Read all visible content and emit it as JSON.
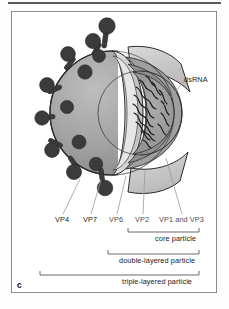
{
  "figure": {
    "panel_letter": "c"
  },
  "callouts": {
    "dsrna": "dsRNA"
  },
  "protein_labels": [
    {
      "id": "vp4",
      "text": "VP4",
      "x": 55,
      "y": 218,
      "tone": "dark"
    },
    {
      "id": "vp7",
      "text": "VP7",
      "x": 84,
      "y": 218,
      "tone": "dark"
    },
    {
      "id": "vp6",
      "text": "VP6",
      "x": 110,
      "y": 218,
      "tone": "grey"
    },
    {
      "id": "vp2",
      "text": "VP2",
      "x": 136,
      "y": 218,
      "tone": "grey"
    },
    {
      "id": "vp1vp3",
      "text": "VP1 and VP3",
      "x": 160,
      "y": 218,
      "tone": "grey"
    }
  ],
  "brackets": [
    {
      "id": "core",
      "label": "core particle",
      "left": 128,
      "right": 199,
      "rule_y": 232,
      "label_x": 199,
      "label_y": 236
    },
    {
      "id": "double",
      "label": "double-layered particle",
      "left": 108,
      "right": 199,
      "rule_y": 254,
      "label_x": 199,
      "label_y": 258
    },
    {
      "id": "triple",
      "label": "triple-layered particle",
      "left": 40,
      "right": 199,
      "rule_y": 275,
      "label_x": 199,
      "label_y": 279
    }
  ],
  "colors": {
    "outer_shell": "#9a9a9a",
    "outer_shell_light": "#b4b4b4",
    "middle_layer": "#c9c9c9",
    "inner_core": "#8f8f8f",
    "core_cavity": "#a2a2a2",
    "spike": "#3b3b3b",
    "rna_line": "#1c1c1c",
    "rim_light": "#e4e4e4",
    "outline": "#2b2b2b",
    "frame": "#8c8c8c",
    "leader": "#9b9b9b"
  }
}
